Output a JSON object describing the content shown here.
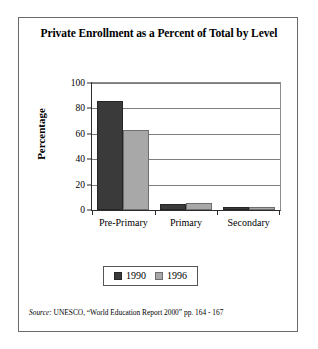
{
  "figure": {
    "title": "Private Enrollment as a Percent of Total by Level",
    "source_prefix": "Source:",
    "source_text": "UNESCO, “World Education Report 2000” pp. 164 - 167"
  },
  "chart_data": {
    "type": "bar",
    "title": "Private Enrollment as a Percent of Total by Level",
    "xlabel": "",
    "ylabel": "Percentage",
    "categories": [
      "Pre-Primary",
      "Primary",
      "Secondary"
    ],
    "series": [
      {
        "name": "1990",
        "color": "#3a3a3a",
        "values": [
          86,
          5,
          1.5
        ]
      },
      {
        "name": "1996",
        "color": "#a8a8a8",
        "values": [
          63,
          5.5,
          2
        ]
      }
    ],
    "ylim": [
      0,
      100
    ],
    "yticks": [
      0,
      20,
      40,
      60,
      80,
      100
    ],
    "ytick_labels": [
      "0",
      "20",
      "40",
      "60",
      "80",
      "100"
    ],
    "grid": true,
    "legend_position": "bottom"
  }
}
